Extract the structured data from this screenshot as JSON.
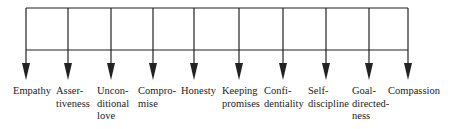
{
  "diagram": {
    "type": "tree",
    "line_color": "#222222",
    "nodes": [
      {
        "id": "empathy",
        "label": "Empathy",
        "lines": [
          "Empathy"
        ],
        "x": 26,
        "text_left": 13
      },
      {
        "id": "assertiveness",
        "label": "Assertiveness",
        "lines": [
          "Asser-",
          "tiveness"
        ],
        "x": 68,
        "text_left": 56
      },
      {
        "id": "unconditional-love",
        "label": "Unconditional love",
        "lines": [
          "Uncon-",
          "ditional",
          "love"
        ],
        "x": 111,
        "text_left": 97
      },
      {
        "id": "compromise",
        "label": "Compromise",
        "lines": [
          "Compro-",
          "mise"
        ],
        "x": 153,
        "text_left": 138
      },
      {
        "id": "honesty",
        "label": "Honesty",
        "lines": [
          "Honesty"
        ],
        "x": 194,
        "text_left": 181
      },
      {
        "id": "keeping-promises",
        "label": "Keeping promises",
        "lines": [
          "Keeping",
          "promises"
        ],
        "x": 239,
        "text_left": 222
      },
      {
        "id": "confidentiality",
        "label": "Confidentiality",
        "lines": [
          "Confi-",
          "dentiality"
        ],
        "x": 283,
        "text_left": 264
      },
      {
        "id": "self-discipline",
        "label": "Self-discipline",
        "lines": [
          "Self-",
          "discipline"
        ],
        "x": 326,
        "text_left": 308
      },
      {
        "id": "goal-directedness",
        "label": "Goal-directedness",
        "lines": [
          "Goal-",
          "directed-",
          "ness"
        ],
        "x": 369,
        "text_left": 352
      },
      {
        "id": "compassion",
        "label": "Compassion",
        "lines": [
          "Compassion"
        ],
        "x": 408,
        "text_left": 388
      }
    ]
  }
}
